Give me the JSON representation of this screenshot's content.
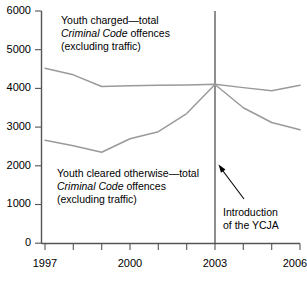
{
  "chart_data": {
    "type": "line",
    "title": "",
    "xlabel": "",
    "ylabel": "",
    "x": [
      1997,
      1998,
      1999,
      2000,
      2001,
      2002,
      2003,
      2004,
      2005,
      2006
    ],
    "xlim": [
      1997,
      2006
    ],
    "ylim": [
      0,
      6000
    ],
    "grid": false,
    "legend_position": "inline-annotations",
    "xticks": [
      1997,
      1998,
      1999,
      2000,
      2001,
      2002,
      2003,
      2004,
      2005,
      2006
    ],
    "xtick_labels_shown": [
      "1997",
      "2000",
      "2003",
      "2006"
    ],
    "yticks": [
      0,
      1000,
      2000,
      3000,
      4000,
      5000,
      6000
    ],
    "ytick_labels": [
      "0",
      "1000",
      "2000",
      "3000",
      "4000",
      "5000",
      "6000"
    ],
    "series": [
      {
        "name": "Youth charged—total Criminal Code offences (excluding traffic)",
        "values": [
          4520,
          4350,
          4050,
          4070,
          4080,
          4090,
          4110,
          4020,
          3940,
          4080
        ]
      },
      {
        "name": "Youth cleared otherwise—total Criminal Code offences (excluding traffic)",
        "values": [
          2660,
          2520,
          2350,
          2700,
          2880,
          3350,
          4100,
          3500,
          3120,
          2930
        ]
      }
    ],
    "annotations": [
      {
        "name": "event-marker",
        "text": "Introduction of the YCJA",
        "x": 2003,
        "type": "vertical-line-with-arrow"
      }
    ]
  },
  "labels": {
    "upper": {
      "line1_a": "Youth charged",
      "line1_dash": "—",
      "line1_b": "total",
      "line2_italic": "Criminal Code",
      "line2_rest": " offences",
      "line3": "(excluding traffic)"
    },
    "lower": {
      "line1_a": "Youth cleared otherwise",
      "line1_dash": "—",
      "line1_b": "total",
      "line2_italic": "Criminal Code",
      "line2_rest": " offences",
      "line3": "(excluding traffic)"
    },
    "event": {
      "line1": "Introduction",
      "line2": "of the YCJA"
    }
  },
  "axis": {
    "y": {
      "t6000": "6000",
      "t5000": "5000",
      "t4000": "4000",
      "t3000": "3000",
      "t2000": "2000",
      "t1000": "1000",
      "t0": "0"
    },
    "x": {
      "t1997": "1997",
      "t2000": "2000",
      "t2003": "2003",
      "t2006": "2006"
    }
  },
  "colors": {
    "series_line": "#9a9a9a",
    "axis": "#555555",
    "event_line": "#444444",
    "text": "#000000",
    "background": "#ffffff"
  }
}
